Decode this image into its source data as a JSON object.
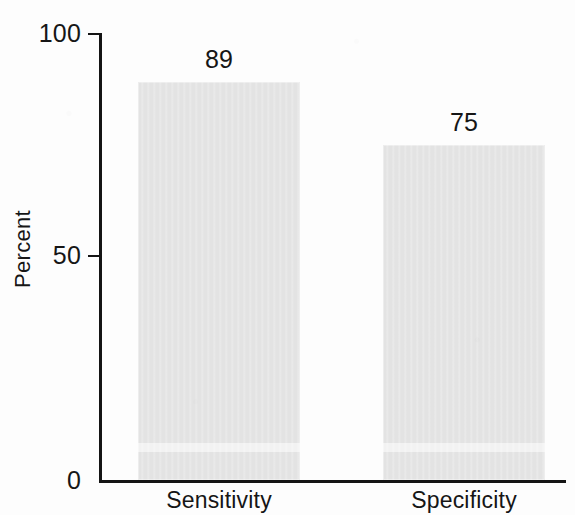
{
  "figure": {
    "background_color": "#fdfdfd",
    "ink_color": "#161616",
    "bar_color": "#e3e3e3"
  },
  "chart_data": {
    "type": "bar",
    "title": "",
    "subtitle": "",
    "categories": [
      "Sensitivity",
      "Specificity"
    ],
    "values": [
      89,
      75
    ],
    "value_labels": [
      "89",
      "75"
    ],
    "xlabel": "",
    "ylabel": "Percent",
    "ylim": [
      0,
      100
    ],
    "y_ticks": [
      0,
      50,
      100
    ],
    "y_tick_labels": [
      "0",
      "50",
      "100"
    ],
    "grid": false,
    "legend": null,
    "legend_position": "none",
    "annotations": [],
    "series": [
      {
        "name": "Percent",
        "values": [
          89,
          75
        ],
        "color": "#e3e3e3"
      }
    ]
  },
  "axes": {
    "y_title": "Percent",
    "tick_100": "100",
    "tick_50": "50",
    "tick_0": "0"
  },
  "bars": [
    {
      "category": "Sensitivity",
      "value_label": "89",
      "category_label": "Sensitivity"
    },
    {
      "category": "Specificity",
      "value_label": "75",
      "category_label": "Specificity"
    }
  ]
}
